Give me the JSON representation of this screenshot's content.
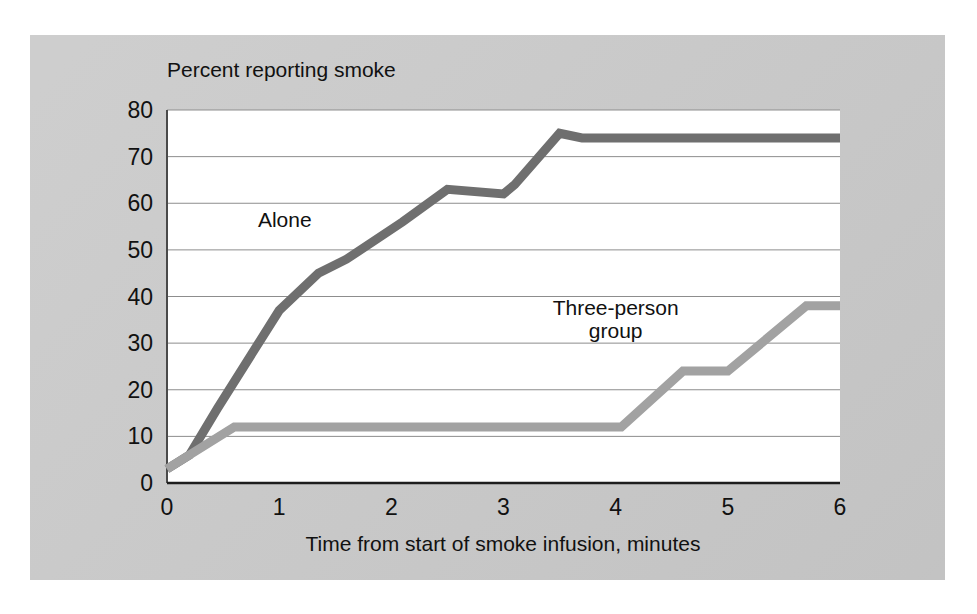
{
  "figure": {
    "panel_background": "#c9c9c9",
    "plot_background": "#ffffff"
  },
  "chart_data": {
    "type": "line",
    "title": "",
    "subtitle": "",
    "ylabel": "Percent reporting smoke",
    "xlabel": "Time from start of smoke infusion, minutes",
    "xlim": [
      0,
      6
    ],
    "ylim": [
      0,
      80
    ],
    "xticks": [
      "0",
      "1",
      "2",
      "3",
      "4",
      "5",
      "6"
    ],
    "xtick_values": [
      0,
      1,
      2,
      3,
      4,
      5,
      6
    ],
    "yticks": [
      "0",
      "10",
      "20",
      "30",
      "40",
      "50",
      "60",
      "70",
      "80"
    ],
    "ytick_values": [
      0,
      10,
      20,
      30,
      40,
      50,
      60,
      70,
      80
    ],
    "grid": "horizontal",
    "legend_position": "inline-annotations",
    "series": [
      {
        "name": "Alone",
        "color": "#6f6f6f",
        "label_x": 1.05,
        "label_y": 55,
        "x": [
          0,
          0.2,
          0.45,
          1.0,
          1.35,
          1.6,
          2.1,
          2.5,
          3.0,
          3.1,
          3.5,
          3.7,
          4.5,
          6.0
        ],
        "y": [
          3,
          6,
          16,
          37,
          45,
          48,
          56,
          63,
          62,
          64,
          75,
          74,
          74,
          74
        ]
      },
      {
        "name": "Three-person group",
        "color": "#a2a2a2",
        "label_x": 4.0,
        "label_y": 34,
        "x": [
          0,
          0.6,
          4.05,
          4.6,
          5.0,
          5.7,
          6.0
        ],
        "y": [
          3,
          12,
          12,
          24,
          24,
          38,
          38
        ]
      }
    ],
    "annotations": [
      {
        "text": "Alone",
        "x": 1.05,
        "y": 55
      },
      {
        "text": "Three-person",
        "x": 4.0,
        "y": 36
      },
      {
        "text": "group",
        "x": 4.0,
        "y": 31
      }
    ]
  }
}
